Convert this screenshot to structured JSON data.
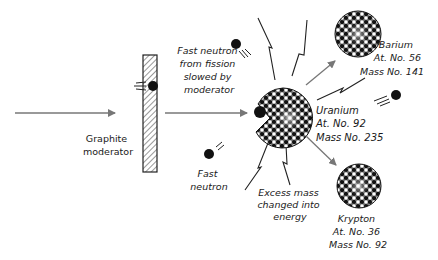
{
  "diagram": {
    "colors": {
      "ink": "#1a1a1a",
      "arrow": "#777777",
      "background": "#ffffff"
    },
    "moderator": {
      "label_line1": "Graphite",
      "label_line2": "moderator"
    },
    "slowed_neutron_note": {
      "line1": "Fast neutron",
      "line2": "from fission",
      "line3": "slowed by",
      "line4": "moderator"
    },
    "uranium": {
      "name": "Uranium",
      "atomic_number": "At. No. 92",
      "mass_number": "Mass No. 235"
    },
    "barium": {
      "name": "Barium",
      "atomic_number": "At. No. 56",
      "mass_number": "Mass No. 141"
    },
    "krypton": {
      "name": "Krypton",
      "atomic_number": "At. No. 36",
      "mass_number": "Mass No. 92"
    },
    "fast_neutron": {
      "line1": "Fast",
      "line2": "neutron"
    },
    "energy_note": {
      "line1": "Excess mass",
      "line2": "changed into",
      "line3": "energy"
    }
  }
}
